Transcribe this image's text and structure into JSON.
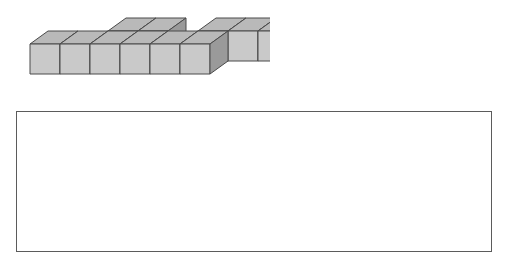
{
  "page": {
    "background_color": "#ffffff",
    "width": 508,
    "height": 267
  },
  "figure": {
    "name": "isometric-cube-solid",
    "cube_count": 11,
    "layers": 1,
    "colors": {
      "top_face": "#b9b9b9",
      "front_face": "#c9c9c9",
      "side_face": "#9a9a9a",
      "outline": "#4a4a4a"
    },
    "geometry": {
      "cube_width": 30,
      "cube_height": 30,
      "iso_dx": 18,
      "iso_dy": -13
    },
    "occupancy": {
      "note": "grid[row][col] = 1 means a cube is present; row 0 is the back row, row 1 is the front row",
      "columns": 6,
      "rows": 2,
      "grid": [
        [
          0,
          0,
          1,
          1,
          0,
          1,
          1,
          1
        ],
        [
          1,
          1,
          1,
          1,
          1,
          1,
          0,
          0
        ]
      ]
    }
  },
  "answer_box": {
    "name": "answer-box",
    "text": "",
    "placeholder": "",
    "border_color": "#5b5b5b",
    "background_color": "#ffffff"
  }
}
